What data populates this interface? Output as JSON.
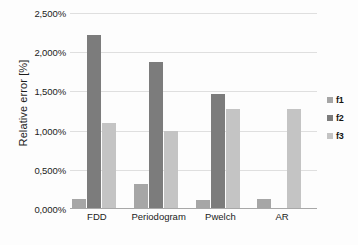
{
  "chart_data": {
    "type": "bar",
    "title": "",
    "xlabel": "",
    "ylabel": "Relative error [%]",
    "categories": [
      "FDD",
      "Periodogram",
      "Pwelch",
      "AR"
    ],
    "series": [
      {
        "name": "f1",
        "color": "#a6a6a6",
        "values": [
          0.13,
          0.32,
          0.12,
          0.13
        ]
      },
      {
        "name": "f2",
        "color": "#7c7c7c",
        "values": [
          2.22,
          1.87,
          1.47,
          0.0
        ]
      },
      {
        "name": "f3",
        "color": "#c4c4c4",
        "values": [
          1.1,
          1.0,
          1.28,
          1.28
        ]
      }
    ],
    "ylim": [
      0,
      2.5
    ],
    "ytick_values": [
      0,
      0.5,
      1.0,
      1.5,
      2.0,
      2.5
    ],
    "ytick_labels": [
      "0,000%",
      "0,500%",
      "1,000%",
      "1,500%",
      "2,000%",
      "2,500%"
    ],
    "grid": true,
    "legend_position": "right",
    "legend_entries": [
      "f1",
      "f2",
      "f3"
    ],
    "value_suffix": "%",
    "decimal_separator": ","
  },
  "colors": {
    "background": "#fdfdfd",
    "gridline": "#dfdfdf",
    "axis": "#a8a8a8",
    "text": "#1b1b1b"
  }
}
